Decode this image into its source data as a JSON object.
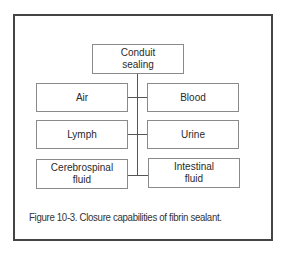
{
  "diagram": {
    "root": {
      "label_line1": "Conduit",
      "label_line2": "sealing"
    },
    "left": [
      {
        "label_line1": "Air",
        "label_line2": ""
      },
      {
        "label_line1": "Lymph",
        "label_line2": ""
      },
      {
        "label_line1": "Cerebrospinal",
        "label_line2": "fluid"
      }
    ],
    "right": [
      {
        "label_line1": "Blood",
        "label_line2": ""
      },
      {
        "label_line1": "Urine",
        "label_line2": ""
      },
      {
        "label_line1": "Intestinal",
        "label_line2": "fluid"
      }
    ]
  },
  "caption": "Figure 10-3. Closure capabilities of fibrin sealant.",
  "colors": {
    "frame": "#444444",
    "box_border": "#8a8a8a",
    "connector": "#555555",
    "text": "#2a2a2a"
  }
}
